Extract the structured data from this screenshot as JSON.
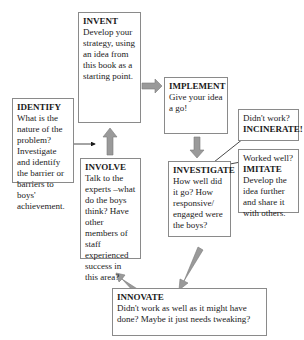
{
  "diagram": {
    "boxes": {
      "invent": {
        "title": "INVENT",
        "body": "Develop your strategy, using an idea from this book as a starting point."
      },
      "implement": {
        "title": "IMPLEMENT",
        "body": "Give your idea a go!"
      },
      "incinerate": {
        "prefix": "Didn't work?",
        "title": "INCINERATE!"
      },
      "imitate": {
        "prefix": "Worked well?",
        "title": "IMITATE",
        "body": "Develop the idea further and share it with others."
      },
      "identify": {
        "title": "IDENTIFY",
        "body": "What is the nature of the problem? Investigate and identify the barrier or barriers to boys' achievement."
      },
      "involve": {
        "title": "INVOLVE",
        "body": "Talk to the experts –what do the boys think? Have other members of staff experienced success in this area?"
      },
      "investigate": {
        "title": "INVESTIGATE",
        "body": "How well did it go? How responsive/ engaged were the boys?"
      },
      "innovate": {
        "title": "INNOVATE",
        "body": "Didn't work as well as it might have done? Maybe it just needs tweaking?"
      }
    },
    "arrow_color": "#9a9a9a",
    "line_color": "#1a1a1a",
    "border_color": "#8a8a8a"
  }
}
